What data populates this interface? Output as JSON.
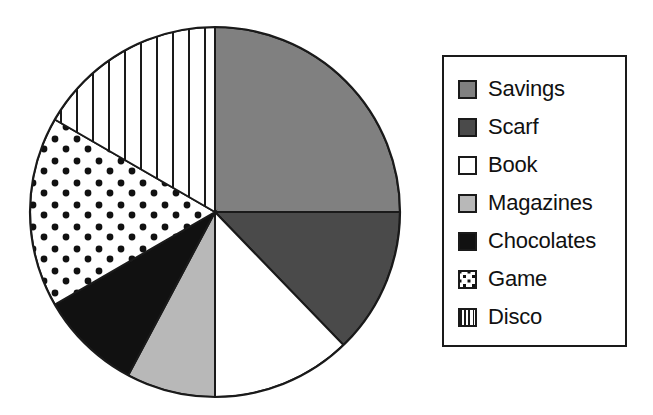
{
  "chart_data": {
    "type": "pie",
    "title": "",
    "xlabel": "",
    "ylabel": "",
    "legend_position": "right",
    "grid": false,
    "start_angle_deg": 0,
    "direction": "clockwise",
    "categories": [
      "Savings",
      "Scarf",
      "Book",
      "Magazines",
      "Chocolates",
      "Game",
      "Disco"
    ],
    "values": [
      25.0,
      12.8,
      12.2,
      7.8,
      8.9,
      16.7,
      16.6
    ],
    "units": "percent",
    "slices": [
      {
        "label": "Savings",
        "percent": 25.0,
        "angle_deg": 90,
        "start_deg": 0,
        "end_deg": 90,
        "fill": "#808080",
        "pattern": "solid"
      },
      {
        "label": "Scarf",
        "percent": 12.8,
        "angle_deg": 46,
        "start_deg": 90,
        "end_deg": 136,
        "fill": "#4a4a4a",
        "pattern": "solid"
      },
      {
        "label": "Book",
        "percent": 12.2,
        "angle_deg": 44,
        "start_deg": 136,
        "end_deg": 180,
        "fill": "#ffffff",
        "pattern": "solid"
      },
      {
        "label": "Magazines",
        "percent": 7.8,
        "angle_deg": 28,
        "start_deg": 180,
        "end_deg": 208,
        "fill": "#b8b8b8",
        "pattern": "solid"
      },
      {
        "label": "Chocolates",
        "percent": 8.9,
        "angle_deg": 32,
        "start_deg": 208,
        "end_deg": 240,
        "fill": "#111111",
        "pattern": "solid"
      },
      {
        "label": "Game",
        "percent": 16.7,
        "angle_deg": 60,
        "start_deg": 240,
        "end_deg": 300,
        "fill": "#ffffff",
        "pattern": "dots"
      },
      {
        "label": "Disco",
        "percent": 16.6,
        "angle_deg": 60,
        "start_deg": 300,
        "end_deg": 360,
        "fill": "#ffffff",
        "pattern": "vertical-stripes"
      }
    ]
  },
  "legend": {
    "items": [
      {
        "label": "Savings",
        "swatch": "swatch-solid-gray"
      },
      {
        "label": "Scarf",
        "swatch": "swatch-solid-dark-gray"
      },
      {
        "label": "Book",
        "swatch": "swatch-white"
      },
      {
        "label": "Magazines",
        "swatch": "swatch-light-gray"
      },
      {
        "label": "Chocolates",
        "swatch": "swatch-black"
      },
      {
        "label": "Game",
        "swatch": "swatch-dots"
      },
      {
        "label": "Disco",
        "swatch": "swatch-stripes"
      }
    ]
  },
  "colors": {
    "outline": "#1a1a1a",
    "savings": "#808080",
    "scarf": "#4a4a4a",
    "book": "#ffffff",
    "magazines": "#b8b8b8",
    "chocolates": "#111111",
    "game": "#ffffff",
    "disco": "#ffffff",
    "background": "#ffffff"
  }
}
